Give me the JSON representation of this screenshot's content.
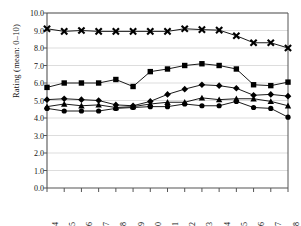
{
  "chart_data": {
    "type": "line",
    "title": "",
    "xlabel": "",
    "ylabel": "Rating (mean: 0–10)",
    "categories": [
      "1984",
      "1985",
      "1986",
      "1987",
      "1988",
      "1989",
      "1990",
      "1991",
      "1992",
      "1993",
      "1994",
      "1995",
      "1996",
      "1997",
      "1998"
    ],
    "ylim": [
      0.0,
      10.0
    ],
    "ytick_values": [
      0.0,
      1.0,
      2.0,
      3.0,
      4.0,
      5.0,
      6.0,
      7.0,
      8.0,
      9.0,
      10.0
    ],
    "ytick_labels": [
      "0.0",
      "1.0",
      "2.0",
      "3.0",
      "4.0",
      "5.0",
      "6.0",
      "7.0",
      "8.0",
      "9.0",
      "10.0"
    ],
    "grid": true,
    "legend": "none",
    "marker_color": "#000000",
    "line_color": "#000000",
    "grid_color": "#cfcfcf",
    "axis_color": "#555555",
    "series": [
      {
        "name": "series-x-cross",
        "marker": "cross",
        "values": [
          9.1,
          8.95,
          9.0,
          8.95,
          8.95,
          8.95,
          8.95,
          8.95,
          9.1,
          9.05,
          9.02,
          8.7,
          8.3,
          8.3,
          8.0
        ]
      },
      {
        "name": "series-square-upper",
        "marker": "square",
        "values": [
          5.75,
          6.0,
          6.0,
          6.0,
          6.2,
          5.8,
          6.65,
          6.8,
          7.0,
          7.1,
          7.0,
          6.8,
          5.9,
          5.85,
          6.05
        ]
      },
      {
        "name": "series-diamond",
        "marker": "diamond",
        "values": [
          5.05,
          5.1,
          5.05,
          5.0,
          4.75,
          4.7,
          4.95,
          5.35,
          5.65,
          5.9,
          5.85,
          5.7,
          5.3,
          5.35,
          5.25
        ]
      },
      {
        "name": "series-triangle",
        "marker": "triangle",
        "values": [
          4.65,
          4.8,
          4.7,
          4.75,
          4.6,
          4.65,
          4.8,
          4.9,
          4.9,
          5.15,
          5.05,
          5.1,
          5.1,
          4.95,
          4.7
        ]
      },
      {
        "name": "series-circle",
        "marker": "circle",
        "values": [
          4.55,
          4.4,
          4.4,
          4.4,
          4.55,
          4.6,
          4.65,
          4.65,
          4.8,
          4.7,
          4.7,
          4.95,
          4.6,
          4.55,
          4.05
        ]
      }
    ]
  }
}
